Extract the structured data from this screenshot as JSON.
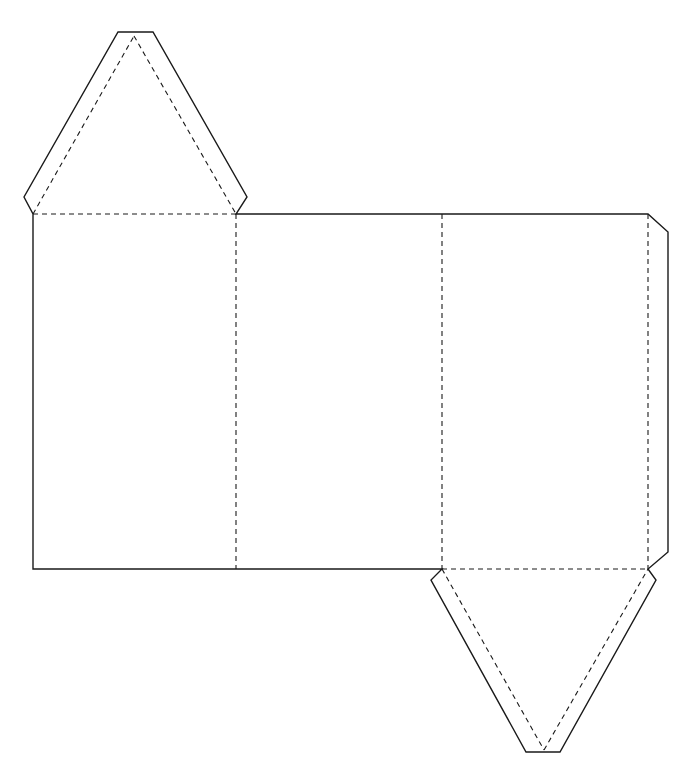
{
  "diagram": {
    "type": "net",
    "line_color": "#1a1a1a",
    "background": "#ffffff",
    "legend": {
      "solid_lines": "cut",
      "dashed_lines": "fold"
    },
    "faces": [
      {
        "name": "rectangle-face-1",
        "bbox": [
          33,
          214,
          236,
          569
        ]
      },
      {
        "name": "rectangle-face-2",
        "bbox": [
          236,
          214,
          442,
          569
        ]
      },
      {
        "name": "rectangle-face-3",
        "bbox": [
          442,
          214,
          648,
          569
        ]
      },
      {
        "name": "top-triangle",
        "points": [
          [
            33,
            214
          ],
          [
            134,
            36
          ],
          [
            236,
            214
          ]
        ]
      },
      {
        "name": "bottom-triangle",
        "points": [
          [
            442,
            569
          ],
          [
            544,
            752
          ],
          [
            648,
            569
          ]
        ]
      }
    ],
    "tabs": [
      {
        "name": "top-triangle-glue-tab"
      },
      {
        "name": "bottom-triangle-glue-tab"
      },
      {
        "name": "side-glue-tab"
      }
    ]
  }
}
